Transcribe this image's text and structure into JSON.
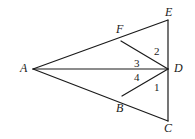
{
  "figure": {
    "type": "geometry-diagram",
    "width": 195,
    "height": 139,
    "background_color": "#ffffff",
    "stroke_color": "#1a1a1a",
    "stroke_width": 1.2,
    "points": [
      {
        "name": "A",
        "label": "A",
        "x": 33,
        "y": 69,
        "label_x": 20,
        "label_y": 62
      },
      {
        "name": "E",
        "label": "E",
        "x": 168,
        "y": 20,
        "label_x": 165,
        "label_y": 6
      },
      {
        "name": "C",
        "label": "C",
        "x": 168,
        "y": 121,
        "label_x": 164,
        "label_y": 122
      },
      {
        "name": "D",
        "label": "D",
        "x": 168,
        "y": 69,
        "label_x": 174,
        "label_y": 62
      },
      {
        "name": "F",
        "label": "F",
        "x": 121,
        "y": 41,
        "label_x": 116,
        "label_y": 23
      },
      {
        "name": "B",
        "label": "B",
        "x": 122,
        "y": 96,
        "label_x": 116,
        "label_y": 102
      }
    ],
    "segments": [
      {
        "name": "segment-AE",
        "from": "A",
        "to": "E"
      },
      {
        "name": "segment-AC",
        "from": "A",
        "to": "C"
      },
      {
        "name": "segment-EC",
        "from": "E",
        "to": "C"
      },
      {
        "name": "segment-AD",
        "from": "A",
        "to": "D"
      },
      {
        "name": "segment-FD",
        "from": "F",
        "to": "D"
      },
      {
        "name": "segment-BD",
        "from": "B",
        "to": "D"
      }
    ],
    "angles": [
      {
        "name": "angle-1",
        "label": "1",
        "x": 154,
        "y": 82
      },
      {
        "name": "angle-2",
        "label": "2",
        "x": 154,
        "y": 46
      },
      {
        "name": "angle-3",
        "label": "3",
        "x": 134,
        "y": 58
      },
      {
        "name": "angle-4",
        "label": "4",
        "x": 134,
        "y": 72
      }
    ]
  }
}
